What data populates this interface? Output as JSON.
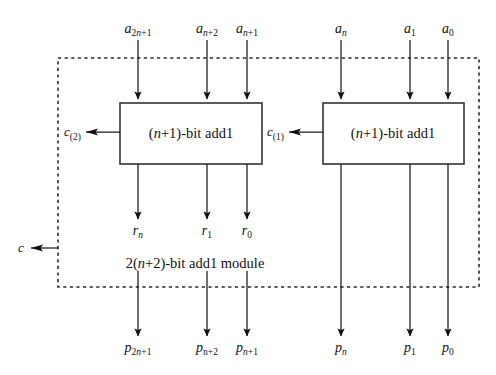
{
  "figure": {
    "type": "block-diagram",
    "module_caption": "2(n+2)-bit add1 module",
    "module_caption_parts": {
      "pre": "2(",
      "var": "n",
      "post": "+2)-bit add1 module"
    }
  },
  "blocks": [
    {
      "id": "left-adder",
      "label": "(n+1)-bit add1",
      "label_parts": {
        "pre": "(",
        "var": "n",
        "post": "+1)-bit add1"
      },
      "x": 120,
      "y": 103,
      "width": 142,
      "height": 61
    },
    {
      "id": "right-adder",
      "label": "(n+1)-bit add1",
      "label_parts": {
        "pre": "(",
        "var": "n",
        "post": "+1)-bit add1"
      },
      "x": 323,
      "y": 103,
      "width": 141,
      "height": 61
    }
  ],
  "inputs": {
    "left_group": [
      {
        "name": "a_2n+1",
        "base": "a",
        "sub_pre": "2",
        "sub_var": "n",
        "sub_post": "+1",
        "x": 138
      },
      {
        "name": "a_n+2",
        "base": "a",
        "sub_pre": "",
        "sub_var": "n",
        "sub_post": "+2",
        "x": 207
      },
      {
        "name": "a_n+1",
        "base": "a",
        "sub_pre": "",
        "sub_var": "n",
        "sub_post": "+1",
        "x": 247
      }
    ],
    "right_group": [
      {
        "name": "a_n",
        "base": "a",
        "sub_pre": "",
        "sub_var": "n",
        "sub_post": "",
        "x": 341
      },
      {
        "name": "a_1",
        "base": "a",
        "sub_pre": "1",
        "sub_var": "",
        "sub_post": "",
        "x": 410
      },
      {
        "name": "a_0",
        "base": "a",
        "sub_pre": "0",
        "sub_var": "",
        "sub_post": "",
        "x": 448
      }
    ]
  },
  "intermediate_outputs": [
    {
      "name": "r_n",
      "base": "r",
      "sub_pre": "",
      "sub_var": "n",
      "sub_post": "",
      "x": 138
    },
    {
      "name": "r_1",
      "base": "r",
      "sub_pre": "1",
      "sub_var": "",
      "sub_post": "",
      "x": 207
    },
    {
      "name": "r_0",
      "base": "r",
      "sub_pre": "0",
      "sub_var": "",
      "sub_post": "",
      "x": 247
    }
  ],
  "outputs": [
    {
      "name": "p_2n+1",
      "base": "p",
      "sub_pre": "2",
      "sub_var": "n",
      "sub_post": "+1",
      "x": 138
    },
    {
      "name": "p_n+2",
      "base": "p",
      "sub_pre": "",
      "sub_var": "n",
      "sub_post": "+2",
      "x": 207,
      "sub_upright": true
    },
    {
      "name": "p_n+1",
      "base": "p",
      "sub_pre": "",
      "sub_var": "n",
      "sub_post": "+1",
      "x": 247
    },
    {
      "name": "p_n",
      "base": "p",
      "sub_pre": "",
      "sub_var": "n",
      "sub_post": "",
      "x": 341
    },
    {
      "name": "p_1",
      "base": "p",
      "sub_pre": "1",
      "sub_var": "",
      "sub_post": "",
      "x": 410
    },
    {
      "name": "p_0",
      "base": "p",
      "sub_pre": "0",
      "sub_var": "",
      "sub_post": "",
      "x": 448
    }
  ],
  "carries": [
    {
      "id": "carry-2",
      "base": "c",
      "sub": "(2)",
      "x": 64,
      "y": 132
    },
    {
      "id": "carry-1",
      "base": "c",
      "sub": "(1)",
      "x": 267,
      "y": 132
    },
    {
      "id": "carry-out",
      "base": "c",
      "sub": "",
      "x": 18,
      "y": 248
    }
  ],
  "style": {
    "line_color": "#1a1a1a",
    "box_fill": "#ffffff",
    "box_stroke": "#333333",
    "dashed_stroke": "#2b2b2b",
    "text_color": "#111111"
  }
}
